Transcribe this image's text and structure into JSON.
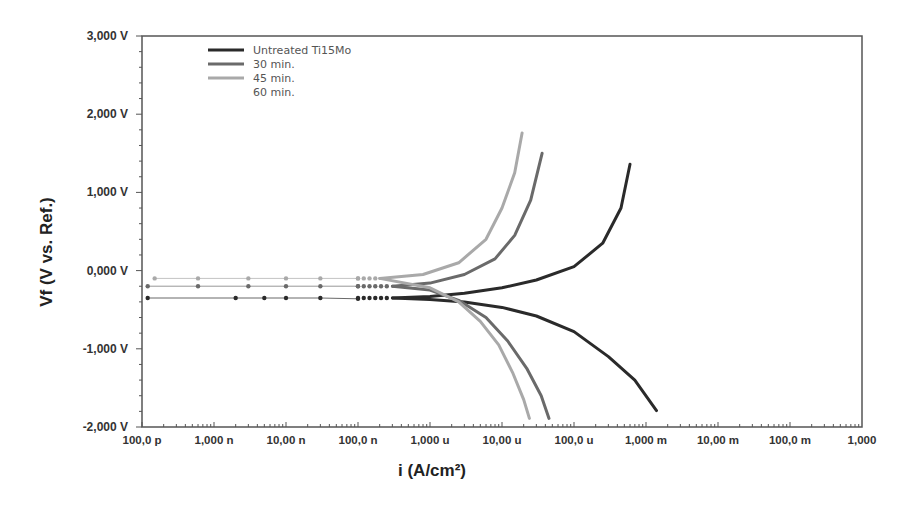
{
  "chart_data": {
    "type": "line",
    "title": "",
    "xlabel": "i (A/cm²)",
    "ylabel": "Vf (V vs. Ref.)",
    "xscale": "log",
    "xlim": [
      1e-10,
      1
    ],
    "ylim": [
      -2.0,
      3.0
    ],
    "x_tick_labels": [
      "100,0 p",
      "1,000 n",
      "10,00 n",
      "100,0 n",
      "1,000 u",
      "10,00 u",
      "100,0 u",
      "1,000 m",
      "10,00 m",
      "100,0 m",
      "1,000"
    ],
    "x_tick_values": [
      1e-10,
      1e-09,
      1e-08,
      1e-07,
      1e-06,
      1e-05,
      0.0001,
      0.001,
      0.01,
      0.1,
      1
    ],
    "y_tick_labels": [
      "3,000 V",
      "2,000 V",
      "1,000 V",
      "0,000 V",
      "-1,000 V",
      "-2,000 V"
    ],
    "y_tick_values": [
      3,
      2,
      1,
      0,
      -1,
      -2
    ],
    "grid": false,
    "legend_position": "upper left",
    "legend": [
      "Untreated Ti15Mo",
      "30 min.",
      "45 min.",
      "60 min."
    ],
    "series": [
      {
        "name": "Untreated Ti15Mo",
        "color": "#2a2a2a",
        "ecorr_V": -0.35,
        "anodic": {
          "i": [
            3e-07,
            1e-06,
            3e-06,
            1e-05,
            3e-05,
            0.0001,
            0.00025,
            0.00045,
            0.0006
          ],
          "v": [
            -0.35,
            -0.33,
            -0.29,
            -0.22,
            -0.12,
            0.05,
            0.35,
            0.8,
            1.36
          ]
        },
        "cathodic": {
          "i": [
            1e-06,
            3e-06,
            1e-05,
            3e-05,
            0.0001,
            0.0003,
            0.0007,
            0.0014
          ],
          "v": [
            -0.37,
            -0.4,
            -0.47,
            -0.58,
            -0.78,
            -1.1,
            -1.4,
            -1.79
          ]
        },
        "passive_scatter": {
          "i": [
            1.2e-10,
            2e-09,
            5e-09,
            1e-08,
            3e-08,
            1e-07
          ],
          "v": [
            -0.35,
            -0.35,
            -0.35,
            -0.35,
            -0.35,
            -0.36
          ]
        }
      },
      {
        "name": "30 min.",
        "color": "#6a6a6a",
        "ecorr_V": -0.2,
        "anodic": {
          "i": [
            3e-07,
            1e-06,
            3e-06,
            8e-06,
            1.5e-05,
            2.5e-05,
            3.6e-05
          ],
          "v": [
            -0.2,
            -0.16,
            -0.05,
            0.15,
            0.45,
            0.9,
            1.5
          ]
        },
        "cathodic": {
          "i": [
            1e-06,
            2.5e-06,
            6e-06,
            1.2e-05,
            2.2e-05,
            3.5e-05,
            4.5e-05
          ],
          "v": [
            -0.25,
            -0.38,
            -0.6,
            -0.9,
            -1.25,
            -1.6,
            -1.89
          ]
        },
        "passive_scatter": {
          "i": [
            1.2e-10,
            6e-10,
            3e-09,
            1e-08,
            3e-08,
            1e-07
          ],
          "v": [
            -0.2,
            -0.2,
            -0.2,
            -0.2,
            -0.2,
            -0.2
          ]
        }
      },
      {
        "name": "45 min.",
        "color": "#a9a9a9",
        "ecorr_V": -0.1,
        "anodic": {
          "i": [
            2e-07,
            8e-07,
            2.5e-06,
            6e-06,
            1e-05,
            1.5e-05,
            1.9e-05
          ],
          "v": [
            -0.1,
            -0.05,
            0.1,
            0.4,
            0.8,
            1.25,
            1.76
          ]
        },
        "cathodic": {
          "i": [
            1e-06,
            2.5e-06,
            5e-06,
            9e-06,
            1.4e-05,
            2e-05,
            2.4e-05
          ],
          "v": [
            -0.22,
            -0.4,
            -0.65,
            -0.95,
            -1.3,
            -1.65,
            -1.89
          ]
        },
        "passive_scatter": {
          "i": [
            1.5e-10,
            6e-10,
            3e-09,
            1e-08,
            3e-08,
            1e-07
          ],
          "v": [
            -0.1,
            -0.1,
            -0.1,
            -0.1,
            -0.1,
            -0.1
          ]
        }
      },
      {
        "name": "60 min.",
        "color": "#d8d8d8",
        "note": "legend entry only; no visible curve",
        "anodic": {
          "i": [],
          "v": []
        },
        "cathodic": {
          "i": [],
          "v": []
        }
      }
    ]
  },
  "plot_area": {
    "left": 142,
    "top": 36,
    "right": 862,
    "bottom": 427
  },
  "colors": {
    "frame": "#555555",
    "background": "#ffffff",
    "text": "#333333"
  }
}
